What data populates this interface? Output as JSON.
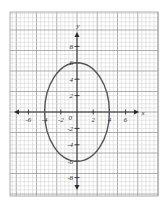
{
  "chart_data": {
    "type": "line",
    "title": "",
    "xlabel": "x",
    "ylabel": "y",
    "xlim": [
      -7.5,
      10
    ],
    "ylim": [
      -10,
      12
    ],
    "grid": true,
    "x_ticks": [
      -6,
      -4,
      -2,
      2,
      4,
      6
    ],
    "x_tick_labels": [
      "-6",
      "-4",
      "-2",
      "2",
      "4",
      "6"
    ],
    "y_ticks": [
      8,
      6,
      4,
      2,
      -2,
      -4,
      -6,
      -8
    ],
    "y_tick_labels": [
      "8",
      "6",
      "4",
      "2",
      "-2",
      "-4",
      "-6",
      "-8"
    ],
    "origin_label": "0",
    "series": [
      {
        "name": "ellipse",
        "shape": "ellipse",
        "center": [
          0,
          0
        ],
        "semi_axis_x": 4,
        "semi_axis_y": 6,
        "intercepts": {
          "x": [
            -4,
            4
          ],
          "y": [
            -6,
            6
          ]
        }
      }
    ]
  },
  "colors": {
    "grid_minor": "#cfcfcf",
    "grid_major": "#9a9a9a",
    "axis": "#2b2b2b",
    "curve": "#555555",
    "background": "#ffffff"
  }
}
